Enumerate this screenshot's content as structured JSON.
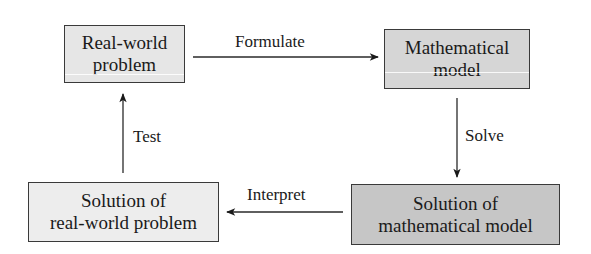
{
  "diagram": {
    "nodes": [
      {
        "id": "real_world_problem",
        "lines": [
          "Real-world",
          "problem"
        ],
        "fill": "#e6e6e6"
      },
      {
        "id": "mathematical_model",
        "lines": [
          "Mathematical",
          "model"
        ],
        "fill": "#d6d6d6"
      },
      {
        "id": "solution_real_world",
        "lines": [
          "Solution of",
          "real-world problem"
        ],
        "fill": "#ededed"
      },
      {
        "id": "solution_math_model",
        "lines": [
          "Solution of",
          "mathematical model"
        ],
        "fill": "#c6c6c6"
      }
    ],
    "edges": [
      {
        "from": "real_world_problem",
        "to": "mathematical_model",
        "label": "Formulate"
      },
      {
        "from": "mathematical_model",
        "to": "solution_math_model",
        "label": "Solve"
      },
      {
        "from": "solution_math_model",
        "to": "solution_real_world",
        "label": "Interpret"
      },
      {
        "from": "solution_real_world",
        "to": "real_world_problem",
        "label": "Test"
      }
    ]
  }
}
